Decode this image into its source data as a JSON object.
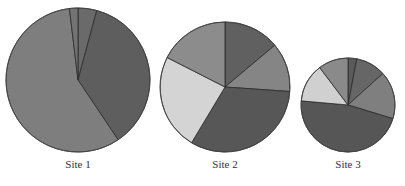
{
  "chart_data": {
    "type": "pie",
    "title": "",
    "pies": [
      {
        "label": "Site 1",
        "cx": 78,
        "cy": 80,
        "r": 72,
        "label_y": 158,
        "slices": [
          {
            "value": 4.2,
            "color": "#6a6a6a"
          },
          {
            "value": 36.4,
            "color": "#5e5e5e"
          },
          {
            "value": 57.5,
            "color": "#7e7e7e"
          },
          {
            "value": 1.9,
            "color": "#737373"
          }
        ]
      },
      {
        "label": "Site 2",
        "cx": 225,
        "cy": 87,
        "r": 65,
        "label_y": 158,
        "slices": [
          {
            "value": 13.9,
            "color": "#606060"
          },
          {
            "value": 12.2,
            "color": "#858585"
          },
          {
            "value": 32.5,
            "color": "#575757"
          },
          {
            "value": 23.9,
            "color": "#d4d4d4"
          },
          {
            "value": 17.5,
            "color": "#8c8c8c"
          }
        ]
      },
      {
        "label": "Site 3",
        "cx": 348,
        "cy": 105,
        "r": 47,
        "label_y": 158,
        "slices": [
          {
            "value": 3.0,
            "color": "#5a5a5a"
          },
          {
            "value": 10.3,
            "color": "#666666"
          },
          {
            "value": 16.4,
            "color": "#7f7f7f"
          },
          {
            "value": 46.7,
            "color": "#565656"
          },
          {
            "value": 13.3,
            "color": "#d0d0d0"
          },
          {
            "value": 10.3,
            "color": "#8a8a8a"
          }
        ]
      }
    ],
    "legend": null,
    "stroke_color": "#2a2a2a"
  }
}
